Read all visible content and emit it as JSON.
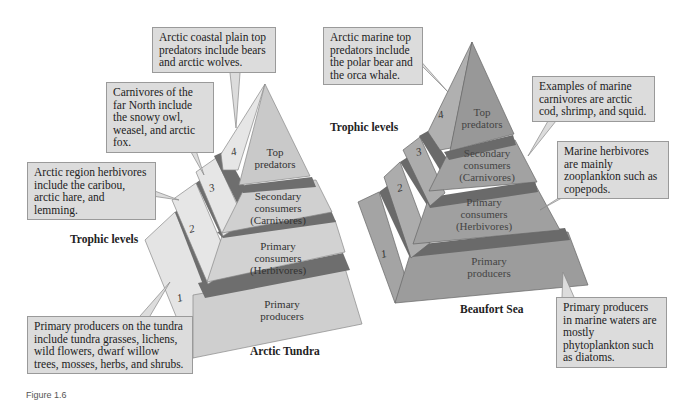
{
  "left_pyramid": {
    "title": "Arctic Tundra",
    "levels": [
      {
        "number": "1",
        "name_line1": "Primary",
        "name_line2": "producers",
        "name_line3": ""
      },
      {
        "number": "2",
        "name_line1": "Primary",
        "name_line2": "consumers",
        "name_line3": "(Herbivores)"
      },
      {
        "number": "3",
        "name_line1": "Secondary",
        "name_line2": "consumers",
        "name_line3": "(Carnivores)"
      },
      {
        "number": "4",
        "name_line1": "Top",
        "name_line2": "predators",
        "name_line3": ""
      }
    ],
    "callouts": {
      "top_predators": "Arctic coastal plain top predators include bears and arctic wolves.",
      "carnivores": "Carnivores of the far North include the snowy owl, weasel, and arctic fox.",
      "herbivores": "Arctic region herbivores include the caribou, arctic hare, and lemming.",
      "producers": "Primary producers on the tundra include tundra grasses, lichens, wild flowers, dwarf willow trees, mosses, herbs, and shrubs."
    },
    "trophic_label": "Trophic levels"
  },
  "right_pyramid": {
    "title": "Beaufort Sea",
    "levels": [
      {
        "number": "1",
        "name_line1": "Primary",
        "name_line2": "producers",
        "name_line3": ""
      },
      {
        "number": "2",
        "name_line1": "Primary",
        "name_line2": "consumers",
        "name_line3": "(Herbivores)"
      },
      {
        "number": "3",
        "name_line1": "Secondary",
        "name_line2": "consumers",
        "name_line3": "(Carnivores)"
      },
      {
        "number": "4",
        "name_line1": "Top",
        "name_line2": "predators",
        "name_line3": ""
      }
    ],
    "callouts": {
      "top_predators": "Arctic marine top predators include the polar bear and the orca whale.",
      "carnivores": "Examples of marine carnivores are arctic cod, shrimp, and squid.",
      "herbivores": "Marine herbivores are mainly zooplankton such as copepods.",
      "producers": "Primary producers in marine waters are mostly phytoplankton such as diatoms."
    },
    "trophic_label": "Trophic levels"
  },
  "caption": "Figure 1.6",
  "colors": {
    "tundra_front": "#cfcfcf",
    "tundra_side": "#e6e6e6",
    "tundra_band": "#6e6e6e",
    "sea_front": "#9a9a9a",
    "sea_side": "#b4b4b4",
    "sea_band": "#6a6a6a",
    "callout_bg": "#dcdcdc"
  }
}
